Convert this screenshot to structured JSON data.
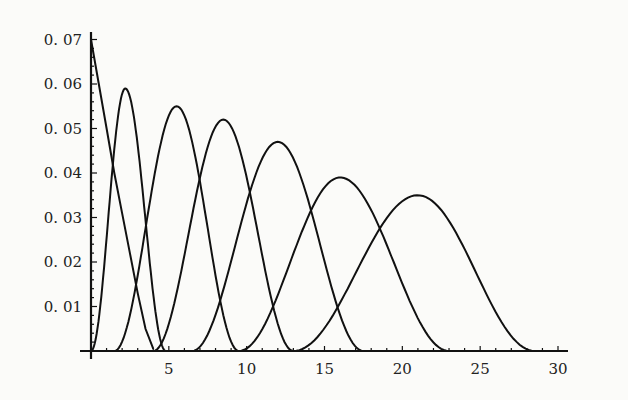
{
  "chart_data": {
    "type": "line",
    "title": "",
    "xlabel": "",
    "ylabel": "",
    "xlim": [
      0,
      30
    ],
    "ylim": [
      0,
      0.072
    ],
    "grid": false,
    "legend": null,
    "x_ticks": [
      5,
      10,
      15,
      20,
      25,
      30
    ],
    "x_tick_labels": [
      "5",
      "10",
      "15",
      "20",
      "25",
      "30"
    ],
    "y_ticks": [
      0.01,
      0.02,
      0.03,
      0.04,
      0.05,
      0.06,
      0.07
    ],
    "y_tick_labels": [
      "0. 01",
      "0. 02",
      "0. 03",
      "0. 04",
      "0. 05",
      "0. 06",
      "0. 07"
    ],
    "series": [
      {
        "name": "curve-1",
        "shape": "decaying",
        "start": {
          "x": 0,
          "y": 0.07
        },
        "end_x": 3.8,
        "points": [
          [
            0,
            0.07
          ],
          [
            0.5,
            0.06
          ],
          [
            1,
            0.05
          ],
          [
            1.5,
            0.04
          ],
          [
            2,
            0.031
          ],
          [
            2.5,
            0.022
          ],
          [
            3,
            0.013
          ],
          [
            3.5,
            0.005
          ],
          [
            4,
            0.0005
          ]
        ]
      },
      {
        "name": "curve-2",
        "shape": "bump",
        "peak": {
          "x": 2.2,
          "y": 0.059
        },
        "support": [
          0,
          4.8
        ]
      },
      {
        "name": "curve-3",
        "shape": "bump",
        "peak": {
          "x": 5.5,
          "y": 0.055
        },
        "support": [
          1.5,
          9.5
        ]
      },
      {
        "name": "curve-4",
        "shape": "bump",
        "peak": {
          "x": 8.5,
          "y": 0.052
        },
        "support": [
          4.0,
          13.0
        ]
      },
      {
        "name": "curve-5",
        "shape": "bump",
        "peak": {
          "x": 12.0,
          "y": 0.047
        },
        "support": [
          6.5,
          17.5
        ]
      },
      {
        "name": "curve-6",
        "shape": "bump",
        "peak": {
          "x": 16.0,
          "y": 0.039
        },
        "support": [
          9.5,
          23.0
        ]
      },
      {
        "name": "curve-7",
        "shape": "bump",
        "peak": {
          "x": 21.0,
          "y": 0.035
        },
        "support": [
          13.0,
          28.5
        ]
      }
    ]
  },
  "colors": {
    "background": "#fbfbf9",
    "ink": "#111111"
  }
}
